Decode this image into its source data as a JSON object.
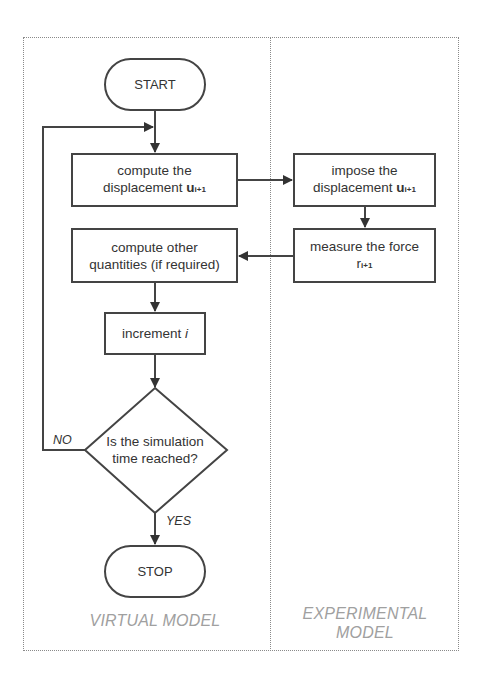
{
  "diagram": {
    "type": "flowchart",
    "lanes": [
      {
        "id": "virtual",
        "label": "VIRTUAL MODEL"
      },
      {
        "id": "experimental",
        "label_line1": "EXPERIMENTAL",
        "label_line2": "MODEL"
      }
    ],
    "nodes": {
      "start": {
        "label": "START",
        "shape": "terminator",
        "lane": "virtual"
      },
      "compute_disp": {
        "line1": "compute the",
        "line2_prefix": "displacement ",
        "var": "u",
        "subscript": "i+1",
        "shape": "process",
        "lane": "virtual"
      },
      "impose_disp": {
        "line1": "impose the",
        "line2_prefix": "displacement ",
        "var": "u",
        "subscript": "i+1",
        "shape": "process",
        "lane": "experimental"
      },
      "measure_force": {
        "line1": "measure the force",
        "var": "r",
        "subscript": "i+1",
        "shape": "process",
        "lane": "experimental"
      },
      "compute_other": {
        "line1": "compute other",
        "line2": "quantities (if required)",
        "shape": "process",
        "lane": "virtual"
      },
      "increment": {
        "prefix": "increment ",
        "var": "i",
        "shape": "process",
        "lane": "virtual"
      },
      "decision": {
        "line1": "Is the simulation",
        "line2": "time reached?",
        "shape": "decision",
        "lane": "virtual"
      },
      "stop": {
        "label": "STOP",
        "shape": "terminator",
        "lane": "virtual"
      }
    },
    "edges": [
      {
        "from": "start",
        "to": "compute_disp"
      },
      {
        "from": "compute_disp",
        "to": "impose_disp"
      },
      {
        "from": "impose_disp",
        "to": "measure_force"
      },
      {
        "from": "measure_force",
        "to": "compute_other"
      },
      {
        "from": "compute_other",
        "to": "increment"
      },
      {
        "from": "increment",
        "to": "decision"
      },
      {
        "from": "decision",
        "to": "compute_disp",
        "label": "NO"
      },
      {
        "from": "decision",
        "to": "stop",
        "label": "YES"
      }
    ],
    "edge_labels": {
      "no": "NO",
      "yes": "YES"
    },
    "colors": {
      "stroke": "#444444",
      "text": "#333333",
      "lane_label": "#a0a0a0",
      "frame": "#8a8a8a"
    }
  }
}
